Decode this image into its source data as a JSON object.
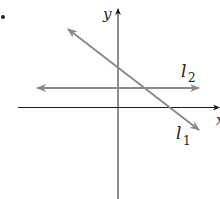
{
  "figure": {
    "bullet": "•",
    "axes": {
      "x_label": "x",
      "y_label": "y"
    },
    "lines": [
      {
        "name": "l",
        "subscript": "1",
        "description": "line with negative slope crossing both axes",
        "color": "#8a8a8a"
      },
      {
        "name": "l",
        "subscript": "2",
        "description": "horizontal line above x-axis",
        "color": "#8a8a8a"
      }
    ],
    "colors": {
      "axis": "#1a1a1a",
      "line": "#8a8a8a",
      "text": "#222222"
    }
  }
}
